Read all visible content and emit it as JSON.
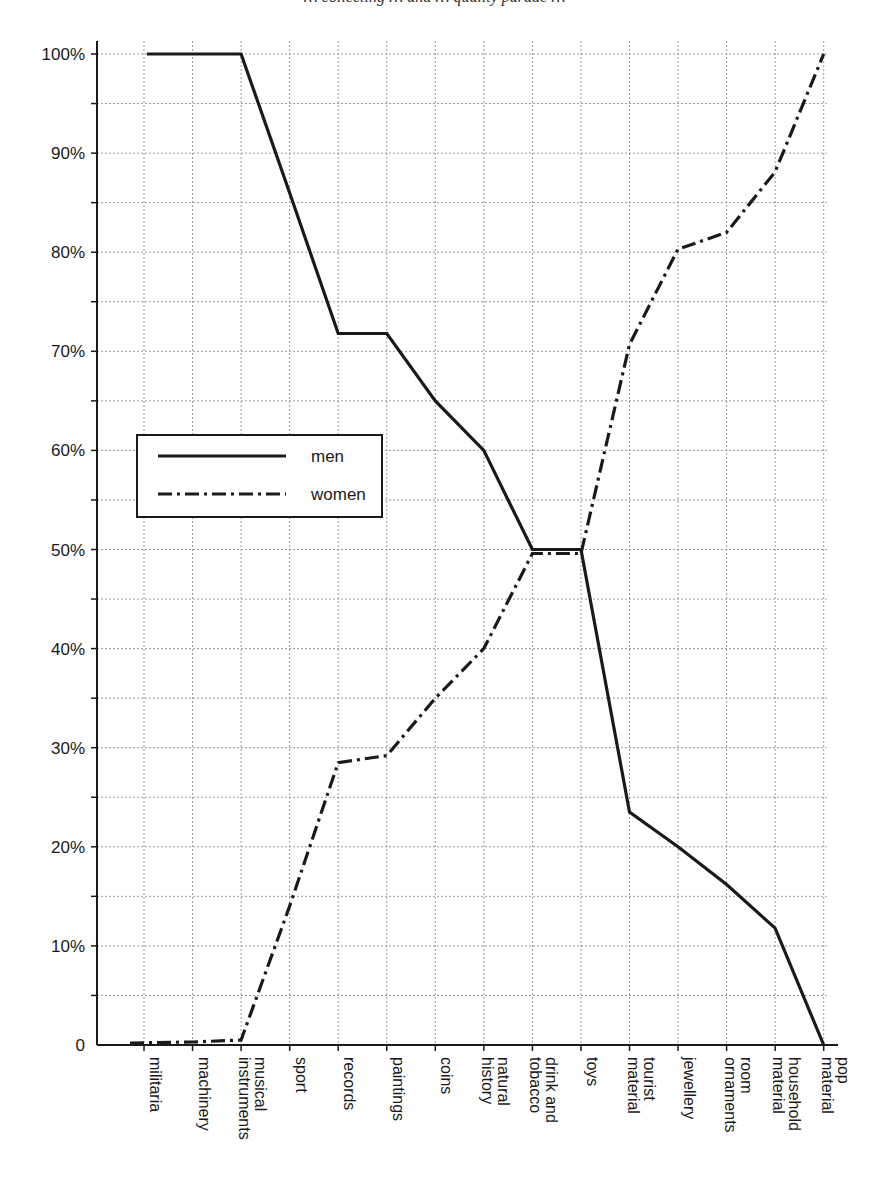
{
  "page": {
    "cropped_title": "… collecting … and … quality parade …"
  },
  "chart_data": {
    "type": "line",
    "title": "",
    "xlabel": "",
    "ylabel": "",
    "ylim": [
      0,
      100
    ],
    "y_ticks": [
      "0",
      "10%",
      "20%",
      "30%",
      "40%",
      "50%",
      "60%",
      "70%",
      "80%",
      "90%",
      "100%"
    ],
    "y_tick_values": [
      0,
      10,
      20,
      30,
      40,
      50,
      60,
      70,
      80,
      90,
      100
    ],
    "y_minor_step": 5,
    "grid": true,
    "grid_style": "dotted",
    "legend_position": "inside-left-middle",
    "categories": [
      [
        "militaria"
      ],
      [
        "machinery"
      ],
      [
        "musical",
        "instruments"
      ],
      [
        "sport"
      ],
      [
        "records"
      ],
      [
        "paintings"
      ],
      [
        "coins"
      ],
      [
        "natural",
        "history"
      ],
      [
        "drink and",
        "tobacco"
      ],
      [
        "toys"
      ],
      [
        "tourist",
        "material"
      ],
      [
        "jewellery"
      ],
      [
        "room",
        "ornaments"
      ],
      [
        "household",
        "material"
      ],
      [
        "pop",
        "material"
      ]
    ],
    "series": [
      {
        "name": "men",
        "style": "solid",
        "color": "#1a1a1a",
        "values": [
          100,
          100,
          100,
          86,
          71.8,
          71.8,
          65,
          60,
          50,
          50,
          23.5,
          20,
          16.2,
          11.8,
          0
        ]
      },
      {
        "name": "women",
        "style": "dash-dot",
        "color": "#1a1a1a",
        "values": [
          0.2,
          0.3,
          0.5,
          14,
          28.5,
          29.2,
          35,
          40,
          49.6,
          49.6,
          70.7,
          80.3,
          82,
          88.1,
          100
        ]
      }
    ]
  },
  "legend": {
    "items": [
      {
        "label": "men",
        "style": "solid"
      },
      {
        "label": "women",
        "style": "dash-dot"
      }
    ]
  }
}
